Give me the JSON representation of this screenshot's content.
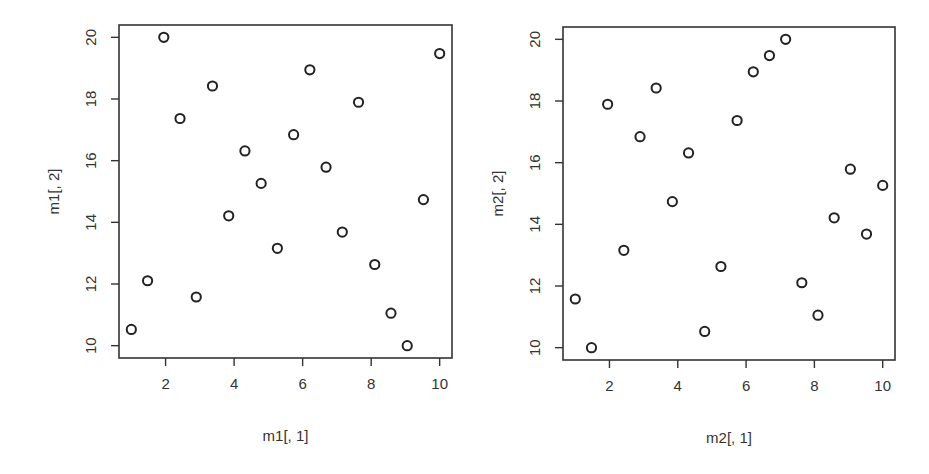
{
  "chart_data": [
    {
      "type": "scatter",
      "title": "",
      "xlabel": "m1[, 1]",
      "ylabel": "m1[, 2]",
      "xlim": [
        0.64,
        10.36
      ],
      "ylim": [
        9.6,
        20.4
      ],
      "x_ticks": [
        2,
        4,
        6,
        8,
        10
      ],
      "y_ticks": [
        10,
        12,
        14,
        16,
        18,
        20
      ],
      "grid": false,
      "legend": null,
      "marker": "open-circle",
      "x": [
        1.0,
        1.474,
        1.947,
        2.421,
        2.895,
        3.368,
        3.842,
        4.316,
        4.789,
        5.263,
        5.737,
        6.211,
        6.684,
        7.158,
        7.632,
        8.105,
        8.579,
        9.053,
        9.526,
        10.0
      ],
      "y": [
        10.526,
        12.105,
        20.0,
        17.368,
        11.579,
        18.421,
        14.211,
        16.316,
        15.263,
        13.158,
        16.842,
        18.947,
        15.789,
        13.684,
        17.895,
        12.632,
        11.053,
        10.0,
        14.737,
        19.474
      ]
    },
    {
      "type": "scatter",
      "title": "",
      "xlabel": "m2[, 1]",
      "ylabel": "m2[, 2]",
      "xlim": [
        0.64,
        10.36
      ],
      "ylim": [
        9.6,
        20.4
      ],
      "x_ticks": [
        2,
        4,
        6,
        8,
        10
      ],
      "y_ticks": [
        10,
        12,
        14,
        16,
        18,
        20
      ],
      "grid": false,
      "legend": null,
      "marker": "open-circle",
      "x": [
        1.0,
        1.474,
        1.947,
        2.421,
        2.895,
        3.368,
        3.842,
        4.316,
        4.789,
        5.263,
        5.737,
        6.211,
        6.684,
        7.158,
        7.632,
        8.105,
        8.579,
        9.053,
        9.526,
        10.0
      ],
      "y": [
        11.579,
        10.0,
        17.895,
        13.158,
        16.842,
        18.421,
        14.737,
        16.316,
        10.526,
        12.632,
        17.368,
        18.947,
        19.474,
        20.0,
        12.105,
        11.053,
        14.211,
        15.789,
        13.684,
        15.263
      ]
    }
  ],
  "panels": [
    {
      "xlabel": "m1[, 1]",
      "ylabel": "m1[, 2]"
    },
    {
      "xlabel": "m2[, 1]",
      "ylabel": "m2[, 2]"
    }
  ]
}
